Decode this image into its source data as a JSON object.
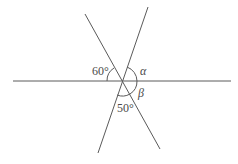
{
  "diagram": {
    "type": "intersecting-lines-angles",
    "lines": [
      {
        "id": "horizontal",
        "x1": 13,
        "y1": 81,
        "x2": 231,
        "y2": 81
      },
      {
        "id": "falling",
        "x1": 85,
        "y1": 14,
        "x2": 160,
        "y2": 149
      },
      {
        "id": "rising",
        "x1": 148,
        "y1": 7,
        "x2": 98,
        "y2": 153
      }
    ],
    "intersection": {
      "x": 122,
      "y": 81
    },
    "labels": {
      "angle_60": "60°",
      "angle_50": "50°",
      "alpha": "α",
      "beta": "β"
    },
    "colors": {
      "line": "#5a5a5a",
      "text": "#4a4a4a",
      "background": "#ffffff"
    }
  }
}
